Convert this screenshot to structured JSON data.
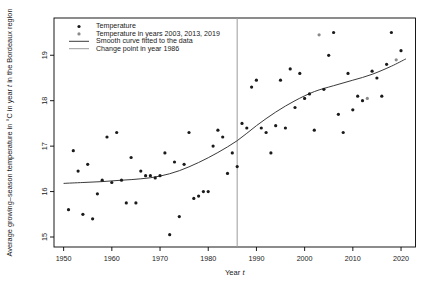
{
  "window": {
    "width": 434,
    "height": 293
  },
  "chart_data": {
    "type": "scatter",
    "title": "",
    "xlabel": "Year t",
    "xlabel_parts": [
      [
        "Year ",
        false
      ],
      [
        "t",
        true
      ]
    ],
    "ylabel": "Average growing–season temperature in °C in year t in the Bordeaux region",
    "ylabel_parts": [
      [
        "Average growing–season temperature in °C in year ",
        false
      ],
      [
        "t",
        true
      ],
      [
        " in the Bordeaux region",
        false
      ]
    ],
    "x_ticks": [
      1950,
      1960,
      1970,
      1980,
      1990,
      2000,
      2010,
      2020
    ],
    "y_ticks": [
      15,
      16,
      17,
      18,
      19
    ],
    "xlim": [
      1948,
      2023
    ],
    "ylim": [
      14.78,
      19.82
    ],
    "grid": false,
    "legend_position": "top-left",
    "legend": [
      {
        "label": "Temperature",
        "marker": "point",
        "color": "#1a1a1a"
      },
      {
        "label": "Temperature in years 2003, 2013, 2019",
        "marker": "point",
        "color": "#8a8a8a"
      },
      {
        "label": "Smooth curve fitted to the data",
        "marker": "line",
        "color": "#3a3a3a"
      },
      {
        "label": "Change point in year 1986",
        "marker": "line",
        "color": "#9c9c9c"
      }
    ],
    "change_point_year": 1986,
    "colors": {
      "point": "#1a1a1a",
      "highlight_point": "#8a8a8a",
      "curve": "#3a3a3a",
      "change_line": "#9c9c9c",
      "axis": "#000000",
      "background": "#ffffff"
    },
    "series": [
      {
        "name": "Temperature",
        "type": "points",
        "points": [
          [
            1951,
            15.6
          ],
          [
            1952,
            16.9
          ],
          [
            1953,
            16.45
          ],
          [
            1954,
            15.5
          ],
          [
            1955,
            16.6
          ],
          [
            1956,
            15.4
          ],
          [
            1957,
            15.95
          ],
          [
            1958,
            16.25
          ],
          [
            1959,
            17.2
          ],
          [
            1960,
            16.2
          ],
          [
            1961,
            17.3
          ],
          [
            1962,
            16.25
          ],
          [
            1963,
            15.75
          ],
          [
            1964,
            16.75
          ],
          [
            1965,
            15.75
          ],
          [
            1966,
            16.45
          ],
          [
            1967,
            16.35
          ],
          [
            1968,
            16.35
          ],
          [
            1969,
            16.3
          ],
          [
            1970,
            16.35
          ],
          [
            1971,
            16.85
          ],
          [
            1972,
            15.05
          ],
          [
            1973,
            16.65
          ],
          [
            1974,
            15.45
          ],
          [
            1975,
            16.6
          ],
          [
            1976,
            17.3
          ],
          [
            1977,
            15.85
          ],
          [
            1978,
            15.9
          ],
          [
            1979,
            16.0
          ],
          [
            1980,
            16.0
          ],
          [
            1981,
            17.0
          ],
          [
            1982,
            17.35
          ],
          [
            1983,
            17.2
          ],
          [
            1984,
            16.4
          ],
          [
            1985,
            16.85
          ],
          [
            1986,
            16.55
          ],
          [
            1987,
            17.5
          ],
          [
            1988,
            17.4
          ],
          [
            1989,
            18.3
          ],
          [
            1990,
            18.45
          ],
          [
            1991,
            17.4
          ],
          [
            1992,
            17.3
          ],
          [
            1993,
            16.85
          ],
          [
            1994,
            17.45
          ],
          [
            1995,
            18.45
          ],
          [
            1996,
            17.4
          ],
          [
            1997,
            18.7
          ],
          [
            1998,
            17.85
          ],
          [
            1999,
            18.6
          ],
          [
            2000,
            18.05
          ],
          [
            2001,
            18.15
          ],
          [
            2002,
            17.35
          ],
          [
            2004,
            18.25
          ],
          [
            2005,
            19.0
          ],
          [
            2006,
            19.5
          ],
          [
            2007,
            17.7
          ],
          [
            2008,
            17.3
          ],
          [
            2009,
            18.6
          ],
          [
            2010,
            17.8
          ],
          [
            2011,
            18.1
          ],
          [
            2012,
            18.0
          ],
          [
            2014,
            18.65
          ],
          [
            2015,
            18.5
          ],
          [
            2016,
            18.1
          ],
          [
            2017,
            18.8
          ],
          [
            2018,
            19.5
          ],
          [
            2020,
            19.1
          ]
        ]
      },
      {
        "name": "Temperature in years 2003, 2013, 2019",
        "type": "points",
        "highlight": true,
        "points": [
          [
            2003,
            19.45
          ],
          [
            2013,
            18.05
          ],
          [
            2019,
            18.9
          ]
        ]
      },
      {
        "name": "Smooth curve fitted to the data",
        "type": "line",
        "points": [
          [
            1950,
            16.18
          ],
          [
            1954,
            16.2
          ],
          [
            1958,
            16.22
          ],
          [
            1962,
            16.25
          ],
          [
            1966,
            16.28
          ],
          [
            1970,
            16.34
          ],
          [
            1974,
            16.46
          ],
          [
            1978,
            16.64
          ],
          [
            1982,
            16.86
          ],
          [
            1986,
            17.12
          ],
          [
            1990,
            17.45
          ],
          [
            1994,
            17.75
          ],
          [
            1998,
            18.0
          ],
          [
            2002,
            18.2
          ],
          [
            2006,
            18.33
          ],
          [
            2010,
            18.45
          ],
          [
            2014,
            18.58
          ],
          [
            2018,
            18.76
          ],
          [
            2021,
            18.92
          ]
        ]
      },
      {
        "name": "Change point in year 1986",
        "type": "vline",
        "x": 1986
      }
    ]
  }
}
